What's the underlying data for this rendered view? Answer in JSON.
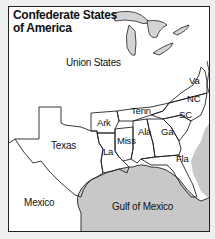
{
  "map": {
    "title_line1": "Confederate States",
    "title_line2": "of America",
    "colors": {
      "water": "#c8c8c8",
      "land": "#ffffff",
      "border": "#222222",
      "background": "#efefef"
    },
    "regions": {
      "union": "Union States",
      "mexico": "Mexico",
      "gulf": "Gulf of Mexico"
    },
    "states": [
      {
        "abbr": "Texas"
      },
      {
        "abbr": "Ark"
      },
      {
        "abbr": "La"
      },
      {
        "abbr": "Miss"
      },
      {
        "abbr": "Tenn"
      },
      {
        "abbr": "Ala"
      },
      {
        "abbr": "Ga"
      },
      {
        "abbr": "Fla"
      },
      {
        "abbr": "SC"
      },
      {
        "abbr": "NC"
      },
      {
        "abbr": "Va"
      }
    ]
  }
}
